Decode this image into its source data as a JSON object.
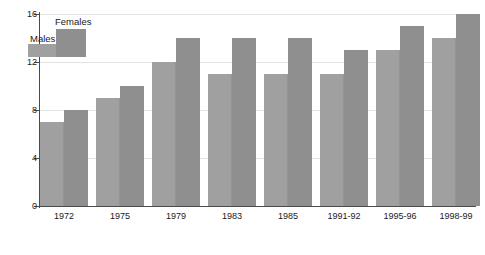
{
  "chart_data": {
    "type": "bar",
    "title": "",
    "xlabel": "",
    "ylabel": "",
    "categories": [
      "1972",
      "1975",
      "1979",
      "1983",
      "1985",
      "1991-92",
      "1995-96",
      "1998-99"
    ],
    "series": [
      {
        "name": "Males",
        "color": "#a0a0a0",
        "values": [
          7,
          9,
          12,
          11,
          11,
          11,
          13,
          14
        ]
      },
      {
        "name": "Females",
        "color": "#8f8f8f",
        "values": [
          8,
          10,
          14,
          14,
          14,
          13,
          15,
          16
        ]
      }
    ],
    "ylim": [
      0,
      16
    ],
    "yticks": [
      0,
      4,
      8,
      12,
      16
    ],
    "ytick_labels": [
      "0",
      "4",
      "8",
      "12",
      "16"
    ],
    "grid": true,
    "legend_position": "top-left"
  },
  "legend": {
    "males_label": "Males",
    "females_label": "Females"
  }
}
